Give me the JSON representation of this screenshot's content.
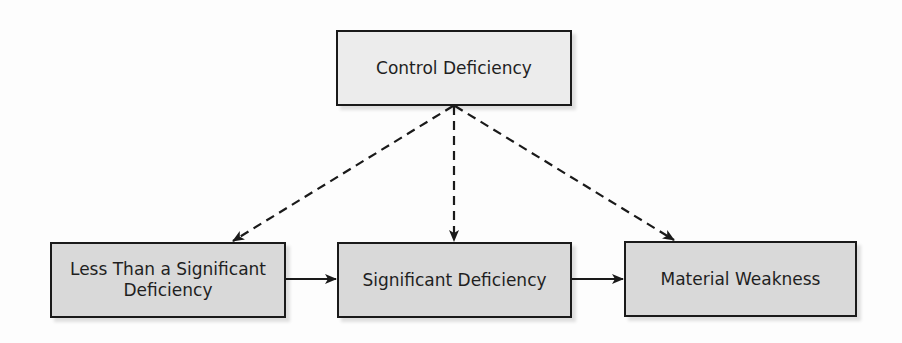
{
  "diagram": {
    "type": "flow",
    "nodes": [
      {
        "id": "control",
        "label": "Control Deficiency",
        "fill": "#ececec"
      },
      {
        "id": "less",
        "label": "Less Than a Significant Deficiency",
        "label_lines": [
          "Less Than a Significant",
          "Deficiency"
        ],
        "fill": "#d9d9d9"
      },
      {
        "id": "significant",
        "label": "Significant Deficiency",
        "fill": "#d9d9d9"
      },
      {
        "id": "material",
        "label": "Material Weakness",
        "fill": "#d9d9d9"
      }
    ],
    "edges": [
      {
        "from": "control",
        "to": "less",
        "style": "dashed"
      },
      {
        "from": "control",
        "to": "significant",
        "style": "dashed"
      },
      {
        "from": "control",
        "to": "material",
        "style": "dashed"
      },
      {
        "from": "less",
        "to": "significant",
        "style": "solid"
      },
      {
        "from": "significant",
        "to": "material",
        "style": "solid"
      }
    ],
    "colors": {
      "border": "#1a1a1a",
      "line": "#1a1a1a",
      "text": "#1f1f1f"
    }
  }
}
